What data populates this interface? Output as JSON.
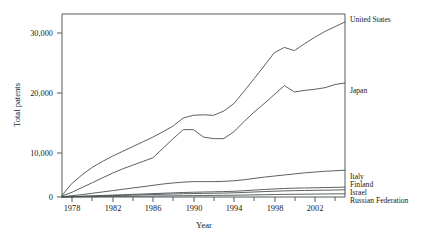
{
  "chart_data": {
    "type": "line",
    "title": "",
    "subtitle": "",
    "xlabel": "Year",
    "ylabel": "Total patents",
    "grid": false,
    "legend_position": "right-inline-labels",
    "xlim": [
      1977,
      2005
    ],
    "ylim": [
      0,
      34500
    ],
    "xticks": [
      1978,
      1982,
      1986,
      1990,
      1994,
      1998,
      2002
    ],
    "xtick_labels": [
      "1978",
      "1982",
      "1986",
      "1990",
      "1994",
      "1998",
      "2002"
    ],
    "xminorticks": [
      1980,
      1984,
      1988,
      1992,
      1996,
      2000,
      2004
    ],
    "yticks": [
      0,
      10000,
      20000,
      30000
    ],
    "ytick_labels": [
      "0",
      "10,000",
      "20,000",
      "30,000"
    ],
    "x": [
      1977,
      1978,
      1979,
      1980,
      1981,
      1982,
      1983,
      1984,
      1985,
      1986,
      1987,
      1988,
      1989,
      1990,
      1991,
      1992,
      1993,
      1994,
      1995,
      1996,
      1997,
      1998,
      1999,
      2000,
      2001,
      2002,
      2003,
      2004,
      2005
    ],
    "series": [
      {
        "name": "United States",
        "label": "United States",
        "values": [
          300,
          2600,
          4200,
          5600,
          6700,
          7700,
          8600,
          9500,
          10400,
          11300,
          12300,
          13400,
          14900,
          15400,
          15500,
          15400,
          16200,
          17600,
          19900,
          22300,
          24700,
          27200,
          28200,
          27600,
          28900,
          30100,
          31200,
          32100,
          33000
        ]
      },
      {
        "name": "Japan",
        "label": "Japan",
        "values": [
          200,
          900,
          1800,
          2700,
          3600,
          4500,
          5300,
          6000,
          6700,
          7400,
          9200,
          11000,
          12700,
          12700,
          11300,
          11000,
          11000,
          12300,
          14200,
          16000,
          17600,
          19300,
          21000,
          19800,
          20100,
          20300,
          20600,
          21200,
          21500
        ]
      },
      {
        "name": "Italy",
        "label": "Italy",
        "values": [
          60,
          250,
          450,
          700,
          950,
          1200,
          1450,
          1700,
          1950,
          2200,
          2450,
          2650,
          2800,
          2900,
          2900,
          2900,
          2950,
          3050,
          3250,
          3500,
          3750,
          3950,
          4150,
          4350,
          4550,
          4700,
          4850,
          4950,
          5050
        ]
      },
      {
        "name": "Finland",
        "label": "Finland",
        "values": [
          20,
          80,
          150,
          220,
          290,
          360,
          430,
          500,
          570,
          640,
          710,
          780,
          850,
          900,
          940,
          980,
          1020,
          1080,
          1180,
          1300,
          1420,
          1520,
          1600,
          1660,
          1700,
          1740,
          1780,
          1820,
          1860
        ]
      },
      {
        "name": "Israel",
        "label": "Israel",
        "values": [
          15,
          60,
          110,
          160,
          210,
          260,
          310,
          360,
          410,
          460,
          510,
          560,
          610,
          650,
          680,
          710,
          740,
          790,
          860,
          940,
          1020,
          1090,
          1150,
          1200,
          1230,
          1260,
          1290,
          1320,
          1350
        ]
      },
      {
        "name": "Russian Federation",
        "label": "Russian Federation",
        "values": [
          5,
          20,
          40,
          60,
          80,
          100,
          120,
          140,
          160,
          180,
          200,
          220,
          240,
          260,
          280,
          300,
          320,
          340,
          370,
          400,
          430,
          460,
          490,
          510,
          530,
          550,
          570,
          590,
          610
        ]
      }
    ]
  },
  "axes": {
    "ylabel": "Total patents",
    "xlabel": "Year"
  },
  "ticks": {
    "y": [
      "30,000",
      "20,000",
      "10,000",
      "0"
    ],
    "x": [
      "1978",
      "1982",
      "1986",
      "1990",
      "1994",
      "1998",
      "2002"
    ]
  },
  "series_labels": {
    "united_states": "United States",
    "japan": "Japan",
    "italy": "Italy",
    "finland": "Finland",
    "israel": "Israel",
    "russian_federation": "Russian Federation"
  },
  "colors": {
    "line": "#4a4f51",
    "frame": "#555a5c",
    "text": "#1a1a1a",
    "background": "#ffffff"
  }
}
